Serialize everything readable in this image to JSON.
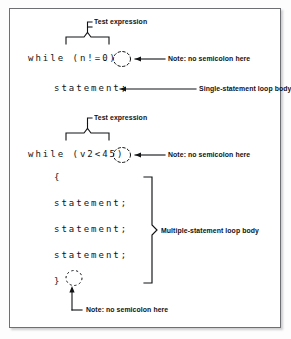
{
  "figure": {
    "background_color": "#ffffff",
    "frame_color": "#6d6f72",
    "ink_color": "#101214"
  },
  "example_single": {
    "code_line_1": "while (n!=0)",
    "code_line_2": "statement;",
    "callout_test_expression": "Test expression",
    "callout_no_semicolon": "Note: no semicolon here",
    "callout_body": "Single-statement loop body"
  },
  "example_multiple": {
    "code_line_1": "while (v2<45)",
    "code_open_brace": "{",
    "code_statement_1": "statement;",
    "code_statement_2": "statement;",
    "code_statement_3": "statement;",
    "code_close_brace": "}",
    "callout_test_expression": "Test expression",
    "callout_no_semicolon_top": "Note: no semicolon here",
    "callout_no_semicolon_bottom": "Note: no semicolon here",
    "callout_body": "Multiple-statement loop body"
  },
  "annotations": {
    "dashed_circle_icon": "dashed-circle-marker",
    "leader_arrow_icon": "leader-arrow",
    "brace_up_icon": "upward-brace",
    "brace_right_icon": "rightward-brace"
  }
}
